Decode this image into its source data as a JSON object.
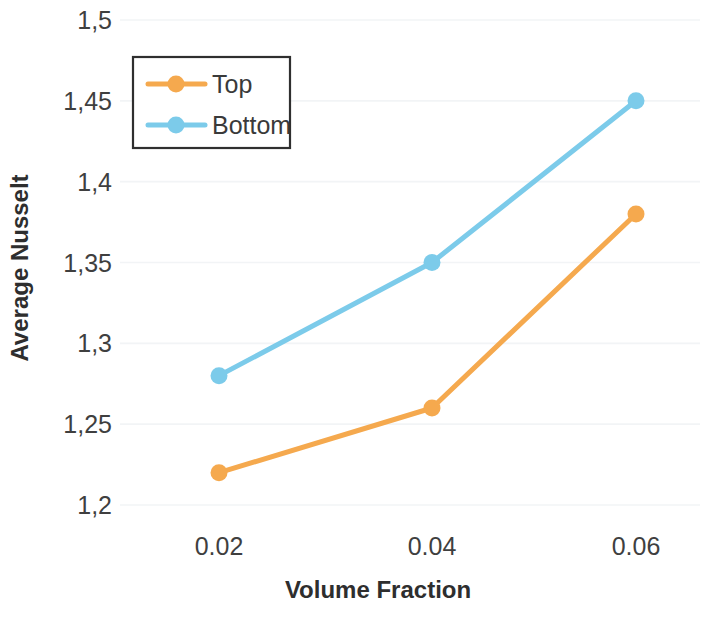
{
  "chart_data": {
    "type": "line",
    "title": "",
    "xlabel": "Volume Fraction",
    "ylabel": "Average Nusselt",
    "categories": [
      "0.02",
      "0.04",
      "0.06"
    ],
    "x": [
      0.02,
      0.04,
      0.06
    ],
    "series": [
      {
        "name": "Top",
        "color": "#F5A94E",
        "values": [
          1.22,
          1.26,
          1.38
        ]
      },
      {
        "name": "Bottom",
        "color": "#7CCBEA",
        "values": [
          1.28,
          1.35,
          1.45
        ]
      }
    ],
    "ylim": [
      1.2,
      1.5
    ],
    "yticks": [
      1.5,
      1.45,
      1.4,
      1.35,
      1.3,
      1.25,
      1.2
    ],
    "ytick_labels": [
      "1,5",
      "1,45",
      "1,4",
      "1,35",
      "1,3",
      "1,25",
      "1,2"
    ],
    "xtick_labels": [
      "0.02",
      "0.04",
      "0.06"
    ],
    "grid": true,
    "grid_axis": "y",
    "legend_position": "top-left",
    "legend_entries": [
      "Top",
      "Bottom"
    ],
    "decimal_separator_y": ",",
    "decimal_separator_x": "."
  },
  "axes": {
    "y_title": "Average Nusselt",
    "x_title": "Volume Fraction"
  },
  "legend": {
    "items": [
      {
        "label": "Top",
        "color": "#F5A94E"
      },
      {
        "label": "Bottom",
        "color": "#7CCBEA"
      }
    ]
  },
  "yticks": [
    {
      "label": "1,5"
    },
    {
      "label": "1,45"
    },
    {
      "label": "1,4"
    },
    {
      "label": "1,35"
    },
    {
      "label": "1,3"
    },
    {
      "label": "1,25"
    },
    {
      "label": "1,2"
    }
  ],
  "xticks": [
    {
      "label": "0.02"
    },
    {
      "label": "0.04"
    },
    {
      "label": "0.06"
    }
  ]
}
